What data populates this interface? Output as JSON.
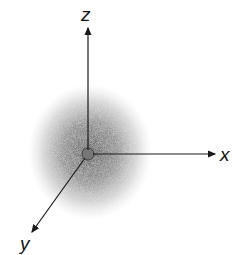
{
  "diagram": {
    "type": "s-orbital electron density cloud",
    "axes": {
      "x_label": "x",
      "y_label": "y",
      "z_label": "z"
    },
    "colors": {
      "cloud": "#555555",
      "axis": "#1a1a1a",
      "background": "#ffffff"
    }
  }
}
